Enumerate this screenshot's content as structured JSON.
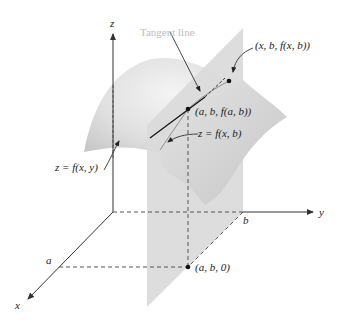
{
  "diagram": {
    "colors": {
      "background": "#ffffff",
      "surface_light": "#e6e6e6",
      "surface_dark": "#cfcfcf",
      "plane": "#d9d9d9",
      "axis": "#333333",
      "label": "#222222",
      "tangent_label": "#bdbdbd"
    },
    "axes": {
      "x_label": "x",
      "y_label": "y",
      "z_label": "z"
    },
    "ticks": {
      "a_label": "a",
      "b_label": "b"
    },
    "labels": {
      "tangent_line": "Tangent line",
      "point_general": "(x, b, f(x, b))",
      "point_ab_surface": "(a, b, f(a, b))",
      "curve": "z = f(x, b)",
      "surface": "z = f(x, y)",
      "point_ab_base": "(a, b, 0)"
    }
  }
}
